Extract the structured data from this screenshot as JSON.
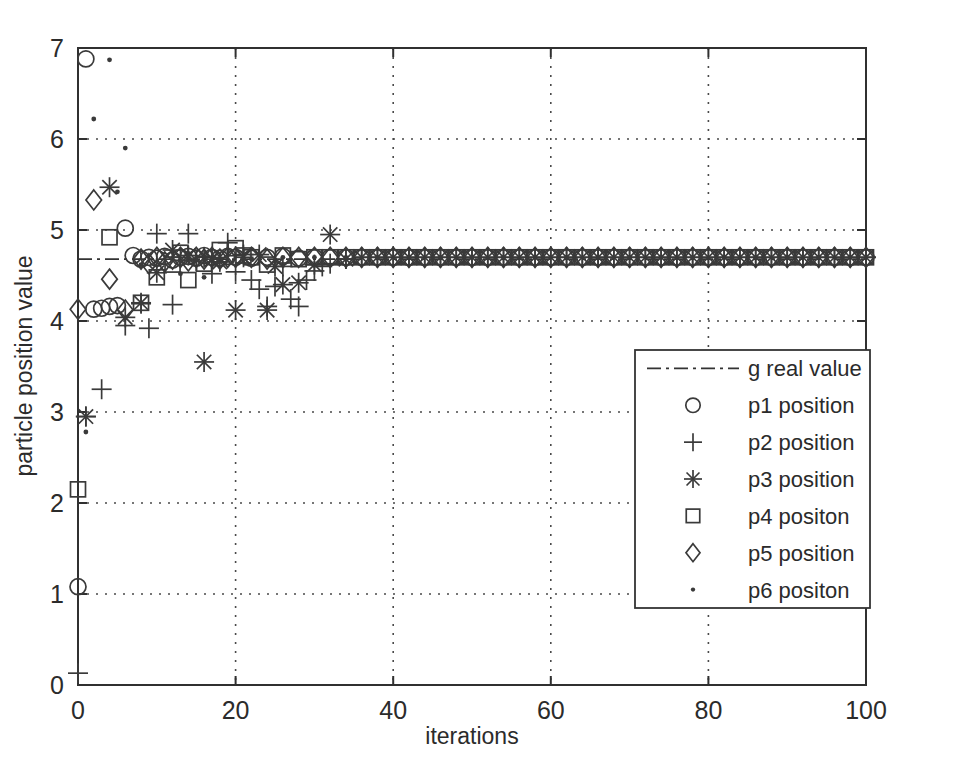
{
  "chart_data": {
    "type": "scatter",
    "title": "",
    "xlabel": "iterations",
    "ylabel": "particle position value",
    "xlim": [
      0,
      100
    ],
    "ylim": [
      0,
      7
    ],
    "xticks": [
      0,
      20,
      40,
      60,
      80,
      100
    ],
    "yticks": [
      0,
      1,
      2,
      3,
      4,
      5,
      6,
      7
    ],
    "grid": true,
    "legend_position": "center-right",
    "reference_line": {
      "name": "g real value",
      "value": 4.68,
      "style": "dash-dot"
    },
    "series": [
      {
        "name": "p1 position",
        "marker": "circle",
        "x": [
          0,
          1,
          2,
          3,
          4,
          5,
          6,
          7,
          8,
          9,
          10,
          11,
          12,
          13,
          14,
          15,
          16,
          17,
          18,
          19,
          20,
          22,
          24,
          26,
          28,
          30,
          32,
          34,
          36,
          38,
          40,
          42,
          44,
          46,
          48,
          50,
          52,
          54,
          56,
          58,
          60,
          62,
          64,
          66,
          68,
          70,
          72,
          74,
          76,
          78,
          80,
          82,
          84,
          86,
          88,
          90,
          92,
          94,
          96,
          98,
          100
        ],
        "y": [
          1.08,
          6.88,
          4.13,
          4.14,
          4.16,
          4.17,
          5.02,
          4.72,
          4.68,
          4.7,
          4.69,
          4.71,
          4.67,
          4.7,
          4.71,
          4.69,
          4.72,
          4.7,
          4.69,
          4.71,
          4.7,
          4.69,
          4.7,
          4.71,
          4.69,
          4.7,
          4.7,
          4.7,
          4.7,
          4.7,
          4.7,
          4.7,
          4.7,
          4.7,
          4.7,
          4.7,
          4.7,
          4.7,
          4.7,
          4.7,
          4.7,
          4.7,
          4.7,
          4.7,
          4.7,
          4.7,
          4.7,
          4.7,
          4.7,
          4.7,
          4.7,
          4.7,
          4.7,
          4.7,
          4.7,
          4.7,
          4.7,
          4.7,
          4.7,
          4.7,
          4.7
        ]
      },
      {
        "name": "p2 position",
        "marker": "plus",
        "x": [
          0,
          1,
          3,
          6,
          8,
          9,
          10,
          12,
          13,
          14,
          15,
          16,
          17,
          19,
          20,
          21,
          22,
          23,
          24,
          25,
          26,
          27,
          28,
          29,
          30,
          31,
          32,
          34,
          36,
          38,
          40,
          42,
          44,
          46,
          48,
          50,
          52,
          54,
          56,
          58,
          60,
          62,
          64,
          66,
          68,
          70,
          72,
          74,
          76,
          78,
          80,
          82,
          84,
          86,
          88,
          90,
          92,
          94,
          96,
          98,
          100
        ],
        "y": [
          0.13,
          2.95,
          3.25,
          3.95,
          4.19,
          3.92,
          4.96,
          4.18,
          4.7,
          4.96,
          4.66,
          4.7,
          4.52,
          4.86,
          4.54,
          4.73,
          4.45,
          4.35,
          4.16,
          4.38,
          4.6,
          4.24,
          4.16,
          4.45,
          4.55,
          4.6,
          4.63,
          4.68,
          4.7,
          4.7,
          4.7,
          4.7,
          4.7,
          4.7,
          4.7,
          4.7,
          4.7,
          4.7,
          4.7,
          4.7,
          4.7,
          4.7,
          4.7,
          4.7,
          4.7,
          4.7,
          4.7,
          4.7,
          4.7,
          4.7,
          4.7,
          4.7,
          4.7,
          4.7,
          4.7,
          4.7,
          4.7,
          4.7,
          4.7,
          4.7,
          4.7
        ]
      },
      {
        "name": "p3 position",
        "marker": "star",
        "x": [
          1,
          4,
          6,
          8,
          10,
          12,
          14,
          16,
          17,
          18,
          20,
          21,
          23,
          24,
          25,
          26,
          28,
          30,
          32,
          34,
          36,
          38,
          40,
          42,
          44,
          46,
          48,
          50,
          52,
          54,
          56,
          58,
          60,
          62,
          64,
          66,
          68,
          70,
          72,
          74,
          76,
          78,
          80,
          82,
          84,
          86,
          88,
          90,
          92,
          94,
          96,
          98,
          100
        ],
        "y": [
          2.95,
          5.47,
          4.04,
          4.2,
          4.53,
          4.78,
          4.72,
          3.55,
          4.68,
          4.65,
          4.12,
          4.7,
          4.73,
          4.12,
          4.6,
          4.4,
          4.42,
          4.62,
          4.95,
          4.68,
          4.7,
          4.7,
          4.7,
          4.7,
          4.7,
          4.7,
          4.7,
          4.7,
          4.7,
          4.7,
          4.7,
          4.7,
          4.7,
          4.7,
          4.7,
          4.7,
          4.7,
          4.7,
          4.7,
          4.7,
          4.7,
          4.7,
          4.7,
          4.7,
          4.7,
          4.7,
          4.7,
          4.7,
          4.7,
          4.7,
          4.7,
          4.7,
          4.7
        ]
      },
      {
        "name": "p4 positon",
        "marker": "square",
        "x": [
          0,
          4,
          8,
          10,
          12,
          13,
          14,
          16,
          18,
          20,
          21,
          22,
          24,
          26,
          28,
          30,
          32,
          34,
          36,
          38,
          40,
          42,
          44,
          46,
          48,
          50,
          52,
          54,
          56,
          58,
          60,
          62,
          64,
          66,
          68,
          70,
          72,
          74,
          76,
          78,
          80,
          82,
          84,
          86,
          88,
          90,
          92,
          94,
          96,
          98,
          100
        ],
        "y": [
          2.15,
          4.92,
          4.2,
          4.48,
          4.62,
          4.75,
          4.45,
          4.63,
          4.78,
          4.8,
          4.72,
          4.7,
          4.62,
          4.72,
          4.68,
          4.7,
          4.7,
          4.7,
          4.7,
          4.7,
          4.7,
          4.7,
          4.7,
          4.7,
          4.7,
          4.7,
          4.7,
          4.7,
          4.7,
          4.7,
          4.7,
          4.7,
          4.7,
          4.7,
          4.7,
          4.7,
          4.7,
          4.7,
          4.7,
          4.7,
          4.7,
          4.7,
          4.7,
          4.7,
          4.7,
          4.7,
          4.7,
          4.7,
          4.7,
          4.7,
          4.7
        ]
      },
      {
        "name": "p5 position",
        "marker": "diamond",
        "x": [
          0,
          2,
          4,
          6,
          8,
          9,
          10,
          11,
          12,
          13,
          14,
          15,
          16,
          17,
          18,
          19,
          20,
          22,
          24,
          26,
          28,
          30,
          32,
          34,
          36,
          38,
          40,
          42,
          44,
          46,
          48,
          50,
          52,
          54,
          56,
          58,
          60,
          62,
          64,
          66,
          68,
          70,
          72,
          74,
          76,
          78,
          80,
          82,
          84,
          86,
          88,
          90,
          92,
          94,
          96,
          98,
          100
        ],
        "y": [
          4.13,
          5.33,
          4.46,
          4.12,
          4.68,
          4.63,
          4.7,
          4.65,
          4.68,
          4.7,
          4.66,
          4.7,
          4.68,
          4.7,
          4.68,
          4.7,
          4.7,
          4.7,
          4.68,
          4.7,
          4.7,
          4.7,
          4.7,
          4.7,
          4.7,
          4.7,
          4.7,
          4.7,
          4.7,
          4.7,
          4.7,
          4.7,
          4.7,
          4.7,
          4.7,
          4.7,
          4.7,
          4.7,
          4.7,
          4.7,
          4.7,
          4.7,
          4.7,
          4.7,
          4.7,
          4.7,
          4.7,
          4.7,
          4.7,
          4.7,
          4.7,
          4.7,
          4.7,
          4.7,
          4.7,
          4.7,
          4.7
        ]
      },
      {
        "name": "p6 positon",
        "marker": "point",
        "x": [
          1,
          2,
          4,
          5,
          6,
          8,
          13,
          16,
          22,
          26,
          30,
          34,
          38,
          42,
          46,
          50,
          54,
          58,
          62,
          66,
          70,
          74,
          78,
          82,
          86,
          90,
          94,
          98
        ],
        "y": [
          2.78,
          6.22,
          6.87,
          5.42,
          5.9,
          4.62,
          4.52,
          4.48,
          4.68,
          4.7,
          4.7,
          4.7,
          4.7,
          4.7,
          4.7,
          4.7,
          4.7,
          4.7,
          4.7,
          4.7,
          4.7,
          4.7,
          4.7,
          4.7,
          4.7,
          4.7,
          4.7,
          4.7
        ]
      }
    ]
  },
  "legend": {
    "entries": [
      {
        "label": "g real value",
        "marker": "dashdot-line"
      },
      {
        "label": "p1 position",
        "marker": "circle"
      },
      {
        "label": "p2 position",
        "marker": "plus"
      },
      {
        "label": "p3 position",
        "marker": "star"
      },
      {
        "label": "p4 positon",
        "marker": "square"
      },
      {
        "label": "p5 position",
        "marker": "diamond"
      },
      {
        "label": "p6 positon",
        "marker": "point"
      }
    ]
  },
  "colors": {
    "background": "#ffffff",
    "axis": "#303030",
    "marker": "#3a3a3a",
    "grid": "#4a4a4a"
  }
}
